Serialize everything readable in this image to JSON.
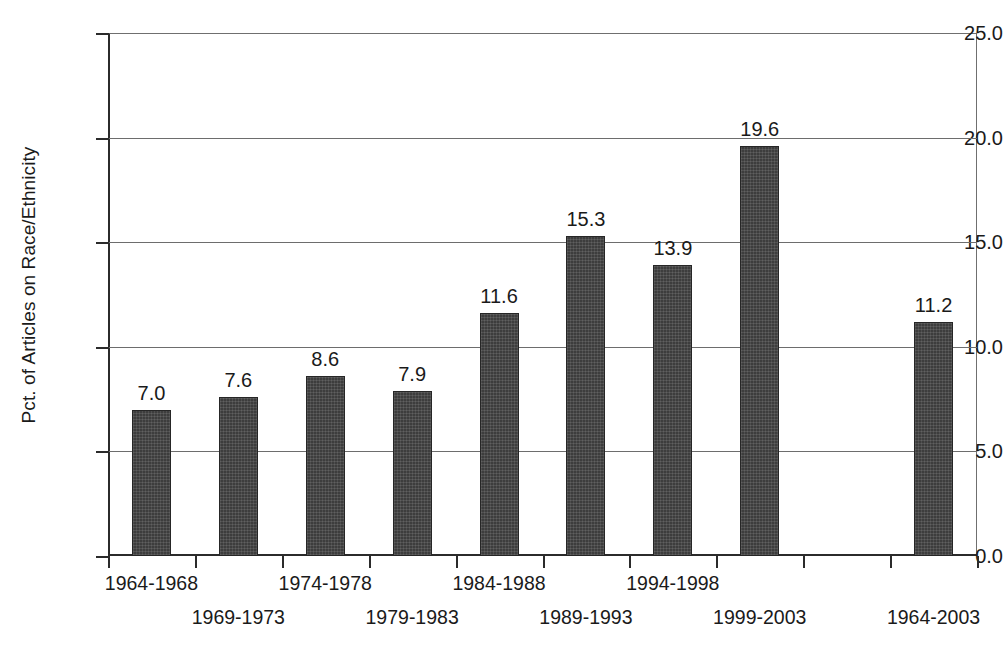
{
  "chart_data": {
    "type": "bar",
    "title": "",
    "xlabel": "",
    "ylabel": "Pct. of Articles on Race/Ethnicity",
    "categories": [
      "1964-1968",
      "1969-1973",
      "1974-1978",
      "1979-1983",
      "1984-1988",
      "1989-1993",
      "1994-1998",
      "1999-2003",
      "",
      "1964-2003"
    ],
    "values": [
      7.0,
      7.6,
      8.6,
      7.9,
      11.6,
      15.3,
      13.9,
      19.6,
      null,
      11.2
    ],
    "value_labels": [
      "7.0",
      "7.6",
      "8.6",
      "7.9",
      "11.6",
      "15.3",
      "13.9",
      "19.6",
      "",
      "11.2"
    ],
    "ylim": [
      0.0,
      25.0
    ],
    "yticks": [
      0.0,
      5.0,
      10.0,
      15.0,
      20.0,
      25.0
    ],
    "ytick_labels": [
      "0.0",
      "5.0",
      "10.0",
      "15.0",
      "20.0",
      "25.0"
    ],
    "grid": true,
    "legend": null,
    "bar_color": "#3d3d3d",
    "axis_color": "#2b2b2b",
    "grid_color": "#6d6d6d",
    "background_color": "#ffffff"
  }
}
